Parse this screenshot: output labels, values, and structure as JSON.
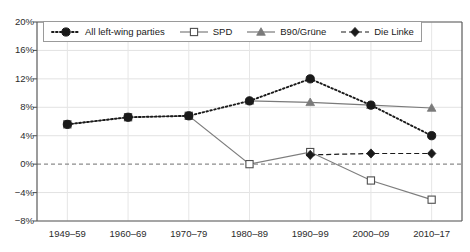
{
  "chart_data": {
    "type": "line",
    "title": "",
    "xlabel": "",
    "ylabel": "",
    "categories": [
      "1949–59",
      "1960–69",
      "1970–79",
      "1980–89",
      "1990–99",
      "2000–09",
      "2010–17"
    ],
    "ylim": [
      -8,
      20
    ],
    "yticks": [
      "20%",
      "16%",
      "12%",
      "8%",
      "4%",
      "0%",
      "−4%",
      "−8%"
    ],
    "ytick_values": [
      20,
      16,
      12,
      8,
      4,
      0,
      -4,
      -8
    ],
    "grid": true,
    "zero_line": true,
    "legend_position": "top-left-inside",
    "series": [
      {
        "name": "All left-wing parties",
        "style": "dotted",
        "marker": "circle",
        "color": "#1a1a1a",
        "values": [
          5.6,
          6.6,
          6.8,
          8.9,
          12.0,
          8.3,
          4.0
        ]
      },
      {
        "name": "SPD",
        "style": "solid",
        "marker": "square-open",
        "color": "#7d7d7d",
        "values": [
          5.6,
          6.6,
          6.8,
          0.0,
          1.7,
          -2.3,
          -5.0
        ]
      },
      {
        "name": "B90/Grüne",
        "style": "solid",
        "marker": "triangle",
        "color": "#7a7a7a",
        "values": [
          null,
          null,
          null,
          8.9,
          8.7,
          8.3,
          7.9
        ]
      },
      {
        "name": "Die Linke",
        "style": "dashed",
        "marker": "diamond",
        "color": "#1a1a1a",
        "values": [
          null,
          null,
          null,
          null,
          1.3,
          1.5,
          1.5
        ]
      }
    ]
  }
}
